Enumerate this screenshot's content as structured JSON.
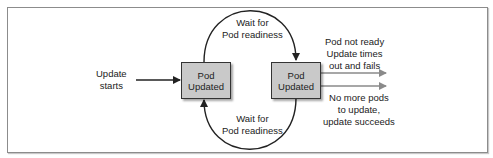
{
  "diagram": {
    "start_label": [
      "Update",
      "starts"
    ],
    "nodes": [
      {
        "id": "pod-1",
        "label": [
          "Pod",
          "Updated"
        ]
      },
      {
        "id": "pod-2",
        "label": [
          "Pod",
          "Updated"
        ]
      }
    ],
    "edges": [
      {
        "from": "start",
        "to": "pod-1",
        "label": []
      },
      {
        "from": "pod-1",
        "to": "pod-2",
        "label": [
          "Wait for",
          "Pod readiness"
        ],
        "shape": "upper-arc"
      },
      {
        "from": "pod-2",
        "to": "pod-1",
        "label": [
          "Wait for",
          "Pod readiness"
        ],
        "shape": "lower-arc"
      },
      {
        "from": "pod-2",
        "to": "fail",
        "label": [
          "Pod not ready",
          "Update times",
          "out and fails"
        ]
      },
      {
        "from": "pod-2",
        "to": "success",
        "label": [
          "No more pods",
          "to update,",
          "update succeeds"
        ]
      }
    ],
    "colors": {
      "node_fill": "#c9c9c9",
      "node_border": "#333333",
      "arrow_dark": "#222222",
      "arrow_gray": "#8a8a8a",
      "frame_border": "#8c8c8c"
    }
  }
}
